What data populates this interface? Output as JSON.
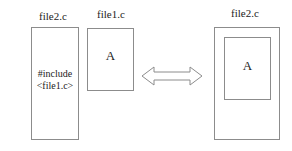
{
  "diagram": {
    "colors": {
      "background": "#ffffff",
      "stroke": "#8c8c8c",
      "text": "#222222"
    },
    "left_group": {
      "caption": "file2.c",
      "box_text": "#include\n<file1.c>"
    },
    "middle_group": {
      "caption": "file1.c",
      "box_text": "A"
    },
    "arrow": {
      "name": "double-headed-arrow",
      "meaning": "equivalent-to"
    },
    "right_group": {
      "caption": "file2.c",
      "inner_box_text": "A"
    }
  }
}
